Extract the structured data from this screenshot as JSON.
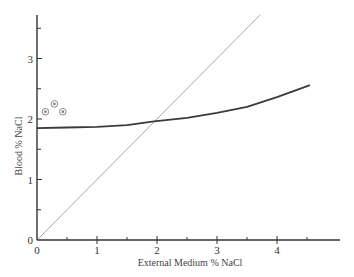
{
  "chart_data": {
    "type": "line",
    "title": "",
    "xlabel": "External Medium % NaCl",
    "ylabel": "Blood % NaCl",
    "xlim": [
      0,
      5
    ],
    "ylim": [
      0,
      3.7
    ],
    "x_ticks": [
      0,
      1,
      2,
      3,
      4
    ],
    "x_minor_ticks": [
      0.5,
      1.5,
      2.5,
      3.5,
      4.5
    ],
    "y_ticks": [
      0,
      1,
      2,
      3
    ],
    "y_minor_ticks": [
      0.5,
      1.5,
      2.5,
      3.5
    ],
    "grid": false,
    "legend": null,
    "series": [
      {
        "name": "Blood concentration curve",
        "style": "solid-dark",
        "x": [
          0,
          0.5,
          1,
          1.5,
          1.95,
          2.5,
          3,
          3.5,
          4,
          4.55
        ],
        "y": [
          1.85,
          1.86,
          1.87,
          1.9,
          1.96,
          2.02,
          2.1,
          2.2,
          2.36,
          2.56
        ]
      },
      {
        "name": "Isosmotic line (y = x)",
        "style": "solid-light",
        "x": [
          0,
          3.72
        ],
        "y": [
          0,
          3.72
        ]
      },
      {
        "name": "Individual measurements",
        "style": "circle-markers",
        "x": [
          0.14,
          0.29,
          0.43
        ],
        "y": [
          2.12,
          2.25,
          2.12
        ]
      }
    ]
  },
  "axes": {
    "x_tick_labels": [
      "0",
      "1",
      "2",
      "3",
      "4"
    ],
    "y_tick_labels": [
      "0",
      "1",
      "2",
      "3"
    ]
  },
  "colors": {
    "axis": "#333333",
    "curve": "#3a3a3a",
    "diagonal": "#a8a8a8",
    "markers": "#888888"
  }
}
